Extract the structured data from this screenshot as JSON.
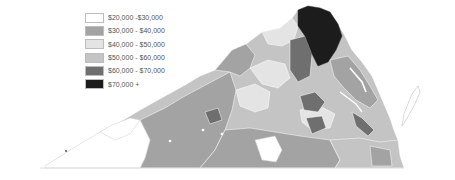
{
  "map": {
    "subject": "Virginia counties by median household income",
    "legend": {
      "items": [
        {
          "label": "$20,000 -$30,000",
          "color": "#ffffff"
        },
        {
          "label": "$30,000 - $40,000",
          "color": "#a3a3a3"
        },
        {
          "label": "$40,000 - $50,000",
          "color": "#e4e4e4"
        },
        {
          "label": "$50,000 - $60,000",
          "color": "#c4c4c4"
        },
        {
          "label": "$60,000 - $70,000",
          "color": "#6f6f6f"
        },
        {
          "label": "$70,000 +",
          "color": "#1c1c1c"
        }
      ]
    }
  }
}
